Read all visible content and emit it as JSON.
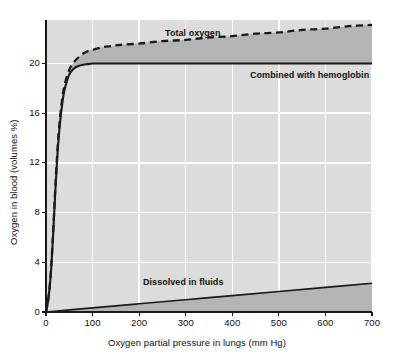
{
  "chart_data": {
    "type": "line",
    "title": "",
    "xlabel": "Oxygen partial pressure in lungs (mm  Hg)",
    "ylabel": "Oxygen in blood (volumes %)",
    "xlim": [
      0,
      700
    ],
    "ylim": [
      0,
      23.5
    ],
    "xticks": [
      0,
      100,
      200,
      300,
      400,
      500,
      600,
      700
    ],
    "yticks": [
      0,
      4,
      8,
      12,
      16,
      20
    ],
    "xtick_labels": [
      "0",
      "100",
      "200",
      "300",
      "400",
      "500",
      "600",
      "700"
    ],
    "ytick_labels": [
      "0",
      "4",
      "8",
      "12",
      "16",
      "20"
    ],
    "grid": true,
    "grid_color": "#ffffff",
    "plot_background": "#dcdcdc",
    "fill_color": "#b4b4b4",
    "line_color": "#1a1a1a",
    "legend_position": "inline-annotations",
    "series": [
      {
        "name": "Total oxygen",
        "style": "dashed",
        "label": "Total oxygen",
        "x": [
          0,
          5,
          10,
          15,
          20,
          25,
          30,
          35,
          40,
          50,
          60,
          70,
          80,
          90,
          100,
          120,
          140,
          160,
          200,
          250,
          300,
          350,
          400,
          450,
          500,
          550,
          600,
          650,
          700
        ],
        "y": [
          0.0,
          1.1,
          3.0,
          6.2,
          10.0,
          13.3,
          15.6,
          17.2,
          18.3,
          19.5,
          20.1,
          20.5,
          20.8,
          21.0,
          21.1,
          21.3,
          21.4,
          21.5,
          21.6,
          21.8,
          21.9,
          22.1,
          22.2,
          22.4,
          22.5,
          22.7,
          22.8,
          23.0,
          23.1
        ]
      },
      {
        "name": "Combined with hemoglobin",
        "style": "solid",
        "label": "Combined with hemoglobin",
        "x": [
          0,
          5,
          10,
          15,
          20,
          25,
          30,
          35,
          40,
          50,
          60,
          70,
          80,
          90,
          100,
          120,
          140,
          160,
          200,
          300,
          400,
          500,
          600,
          700
        ],
        "y": [
          0.0,
          1.0,
          2.9,
          6.0,
          9.7,
          12.9,
          15.2,
          16.8,
          17.9,
          19.1,
          19.6,
          19.8,
          19.9,
          19.95,
          20.0,
          20.0,
          20.0,
          20.0,
          20.0,
          20.0,
          20.0,
          20.0,
          20.0,
          20.0
        ]
      },
      {
        "name": "Dissolved in fluids",
        "style": "solid",
        "label": "Dissolved in fluids",
        "x": [
          0,
          100,
          200,
          300,
          400,
          500,
          600,
          700
        ],
        "y": [
          0.0,
          0.33,
          0.66,
          0.99,
          1.32,
          1.65,
          1.98,
          2.31
        ]
      }
    ],
    "annotations": [
      {
        "text": "Total oxygen",
        "x": 260,
        "y": 22.6
      },
      {
        "text": "Combined with hemoglobin",
        "x": 450,
        "y": 19.3
      },
      {
        "text": "Dissolved in fluids",
        "x": 220,
        "y": 2.9
      }
    ]
  },
  "axes": {
    "x_title": "Oxygen partial pressure in lungs (mm  Hg)",
    "y_title": "Oxygen in blood (volumes %)"
  },
  "labels": {
    "total_oxygen": "Total oxygen",
    "combined_hemoglobin": "Combined with hemoglobin",
    "dissolved_fluids": "Dissolved in fluids"
  },
  "ticks": {
    "x": [
      "0",
      "100",
      "200",
      "300",
      "400",
      "500",
      "600",
      "700"
    ],
    "y": [
      "0",
      "4",
      "8",
      "12",
      "16",
      "20"
    ]
  }
}
